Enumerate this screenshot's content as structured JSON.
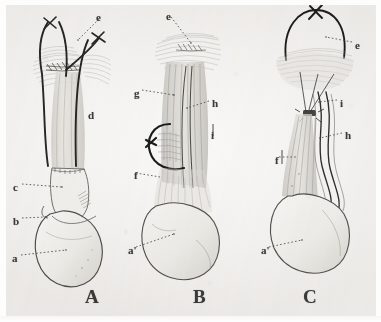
{
  "plate": {
    "title": "Anatomical plate: three surgical figures",
    "background_color": "#f2f1ef",
    "ink_color": "#2b2a28",
    "pencil_color": "#8f8d88",
    "width": 381,
    "height": 322
  },
  "figures": [
    {
      "id": "A",
      "caption": "A",
      "caption_x": 85,
      "caption_y": 286,
      "labels": [
        {
          "key": "e",
          "text": "e",
          "x": 96,
          "y": 12,
          "leader_to_x": 74,
          "leader_to_y": 38
        },
        {
          "key": "d",
          "text": "d",
          "x": 88,
          "y": 110,
          "leader_to_x": 88,
          "leader_to_y": 110
        },
        {
          "key": "c",
          "text": "c",
          "x": 13,
          "y": 182,
          "leader_to_x": 58,
          "leader_to_y": 186
        },
        {
          "key": "b",
          "text": "b",
          "x": 13,
          "y": 216,
          "leader_to_x": 45,
          "leader_to_y": 216
        },
        {
          "key": "a",
          "text": "a",
          "x": 12,
          "y": 253,
          "leader_to_x": 64,
          "leader_to_y": 248
        }
      ]
    },
    {
      "id": "B",
      "caption": "B",
      "caption_x": 193,
      "caption_y": 286,
      "labels": [
        {
          "key": "e",
          "text": "e",
          "x": 166,
          "y": 11,
          "leader_to_x": 190,
          "leader_to_y": 42
        },
        {
          "key": "g",
          "text": "g",
          "x": 134,
          "y": 88,
          "leader_to_x": 172,
          "leader_to_y": 94
        },
        {
          "key": "h",
          "text": "h",
          "x": 212,
          "y": 98,
          "leader_to_x": 188,
          "leader_to_y": 107
        },
        {
          "key": "i",
          "text": "i",
          "x": 211,
          "y": 130,
          "leader_to_x": 211,
          "leader_to_y": 130
        },
        {
          "key": "f",
          "text": "f",
          "x": 134,
          "y": 170,
          "leader_to_x": 134,
          "leader_to_y": 170
        },
        {
          "key": "a1",
          "text": "a'",
          "x": 128,
          "y": 245,
          "leader_to_x": 172,
          "leader_to_y": 232
        }
      ]
    },
    {
      "id": "C",
      "caption": "C",
      "caption_x": 303,
      "caption_y": 286,
      "labels": [
        {
          "key": "e",
          "text": "e",
          "x": 355,
          "y": 40,
          "leader_to_x": 326,
          "leader_to_y": 36
        },
        {
          "key": "i",
          "text": "i",
          "x": 340,
          "y": 98,
          "leader_to_x": 318,
          "leader_to_y": 100
        },
        {
          "key": "h",
          "text": "h",
          "x": 345,
          "y": 130,
          "leader_to_x": 318,
          "leader_to_y": 136
        },
        {
          "key": "f",
          "text": "f",
          "x": 275,
          "y": 155,
          "leader_to_x": 296,
          "leader_to_y": 156
        },
        {
          "key": "a1",
          "text": "a'",
          "x": 261,
          "y": 245,
          "leader_to_x": 300,
          "leader_to_y": 238
        }
      ]
    }
  ]
}
